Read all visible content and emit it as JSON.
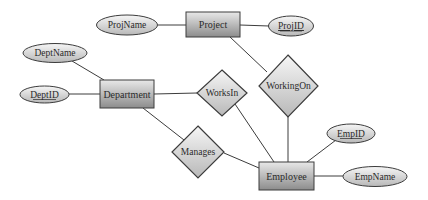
{
  "diagram": {
    "type": "er-diagram",
    "entities": [
      {
        "id": "project",
        "label": "Project"
      },
      {
        "id": "department",
        "label": "Department"
      },
      {
        "id": "employee",
        "label": "Employee"
      }
    ],
    "relationships": [
      {
        "id": "workson",
        "label": "WorkingOn",
        "connects": [
          "project",
          "employee"
        ]
      },
      {
        "id": "worksin",
        "label": "WorksIn",
        "connects": [
          "department",
          "employee"
        ]
      },
      {
        "id": "manages",
        "label": "Manages",
        "connects": [
          "department",
          "employee"
        ]
      }
    ],
    "attributes": [
      {
        "id": "projname",
        "label": "ProjName",
        "entity": "project",
        "key": false
      },
      {
        "id": "projid",
        "label": "ProjID",
        "entity": "project",
        "key": true
      },
      {
        "id": "deptname",
        "label": "DeptName",
        "entity": "department",
        "key": false
      },
      {
        "id": "deptid",
        "label": "DeptID",
        "entity": "department",
        "key": true
      },
      {
        "id": "empid",
        "label": "EmpID",
        "entity": "employee",
        "key": true
      },
      {
        "id": "empname",
        "label": "EmpName",
        "entity": "employee",
        "key": false
      }
    ]
  },
  "labels": {
    "project": "Project",
    "department": "Department",
    "employee": "Employee",
    "workingon": "WorkingOn",
    "worksin": "WorksIn",
    "manages": "Manages",
    "projname": "ProjName",
    "projid": "ProjID",
    "deptname": "DeptName",
    "deptid": "DeptID",
    "empid": "EmpID",
    "empname": "EmpName"
  },
  "colors": {
    "stroke": "#3c3c3c",
    "entity_light": "#e6e6e6",
    "entity_dark": "#8e8e8e",
    "shape_light": "#f4f4f4",
    "shape_dark": "#bdbdbd"
  }
}
